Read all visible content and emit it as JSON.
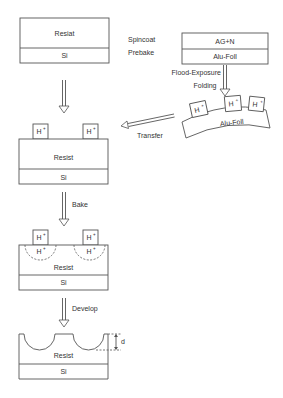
{
  "figure": {
    "step1": {
      "top_layer": "Resiat",
      "bottom_layer": "Si"
    },
    "process_labels": {
      "spincoat": "Spincoat",
      "prebake": "Prebake"
    },
    "foil_stack": {
      "top_layer": "AG+N",
      "bottom_layer": "Alu-Foll"
    },
    "flood_labels": {
      "flood_exposure": "Flood-Exposure",
      "folding": "Folding"
    },
    "curved_foil": {
      "label": "Alu-Foll",
      "proton_count": 3
    },
    "transfer_label": "Transfer",
    "step2": {
      "top_layer": "Resist",
      "bottom_layer": "Si"
    },
    "bake_label": "Bake",
    "step3": {
      "top_layer": "Resist",
      "bottom_layer": "Si"
    },
    "develop_label": "Develop",
    "step4": {
      "top_layer": "Resist",
      "bottom_layer": "Si",
      "depth_label": "d"
    },
    "proton": {
      "base": "H",
      "charge": "+"
    }
  }
}
